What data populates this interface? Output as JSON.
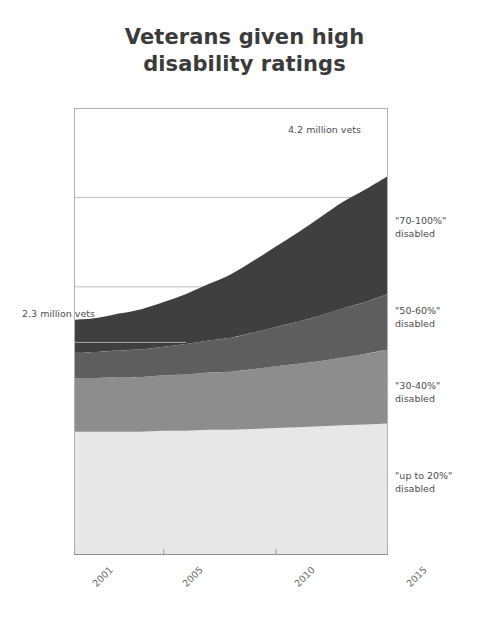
{
  "title": {
    "line1": "Veterans given high",
    "line2": "disability ratings"
  },
  "annotations": {
    "start": "2.3 million vets",
    "end": "4.2 million vets"
  },
  "axis": {
    "ticks": [
      "2001",
      "2005",
      "2010",
      "2015"
    ]
  },
  "series_labels": [
    {
      "range": "\"up to 20%\"",
      "word": "disabled"
    },
    {
      "range": "\"30-40%\"",
      "word": "disabled"
    },
    {
      "range": "\"50-60%\"",
      "word": "disabled"
    },
    {
      "range": "\"70-100%\"",
      "word": "disabled"
    }
  ],
  "colors": {
    "band_up_to_20": "#e7e7e7",
    "band_30_40": "#8d8d8d",
    "band_50_60": "#5e5e5e",
    "band_70_100": "#3f3f3f",
    "gridline": "#b9b9b9",
    "frame": "#b0b0b0",
    "text": "#4d4d4d",
    "title": "#3b3b3b"
  },
  "chart_data": {
    "type": "area",
    "title": "Veterans given high disability ratings",
    "subtitle": "",
    "xlabel": "",
    "ylabel": "",
    "stacked": true,
    "grid": true,
    "legend_position": "right-inline",
    "xlim": [
      2001,
      2015
    ],
    "ylim": [
      0,
      5.0
    ],
    "y_gridlines": [
      1.0,
      2.0,
      3.0,
      4.0,
      5.0
    ],
    "x_tick_values": [
      2001,
      2005,
      2010,
      2015
    ],
    "x_tick_labels": [
      "2001",
      "2005",
      "2010",
      "2015"
    ],
    "units": "millions of veterans",
    "x": [
      2001,
      2002,
      2003,
      2004,
      2005,
      2006,
      2007,
      2008,
      2009,
      2010,
      2011,
      2012,
      2013,
      2014,
      2015
    ],
    "series": [
      {
        "name": "\"up to 20%\" disabled",
        "color": "#e7e7e7",
        "values": [
          1.38,
          1.38,
          1.38,
          1.38,
          1.39,
          1.39,
          1.4,
          1.4,
          1.41,
          1.42,
          1.43,
          1.44,
          1.45,
          1.46,
          1.47
        ]
      },
      {
        "name": "\"30-40%\" disabled",
        "color": "#8d8d8d",
        "values": [
          0.6,
          0.6,
          0.61,
          0.61,
          0.62,
          0.63,
          0.64,
          0.65,
          0.67,
          0.69,
          0.71,
          0.73,
          0.76,
          0.79,
          0.83
        ]
      },
      {
        "name": "\"50-60%\" disabled",
        "color": "#5e5e5e",
        "values": [
          0.29,
          0.29,
          0.3,
          0.31,
          0.32,
          0.34,
          0.36,
          0.38,
          0.41,
          0.44,
          0.47,
          0.51,
          0.55,
          0.58,
          0.62
        ]
      },
      {
        "name": "\"70-100%\" disabled",
        "color": "#3f3f3f",
        "values": [
          0.36,
          0.38,
          0.41,
          0.45,
          0.5,
          0.56,
          0.63,
          0.71,
          0.8,
          0.9,
          1.0,
          1.1,
          1.19,
          1.26,
          1.32
        ]
      }
    ],
    "totals": [
      2.3,
      2.35,
      2.43,
      2.52,
      2.64,
      2.79,
      2.96,
      3.15,
      3.37,
      3.6,
      3.82,
      4.0,
      4.12,
      4.17,
      4.2
    ],
    "annotations": [
      {
        "text": "2.3 million vets",
        "x": 2001,
        "y": 2.3,
        "position": "left"
      },
      {
        "text": "4.2 million vets",
        "x": 2015,
        "y": 4.2,
        "position": "top-right"
      }
    ]
  }
}
